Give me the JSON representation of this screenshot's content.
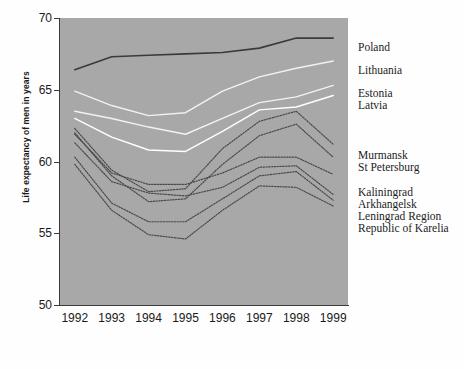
{
  "chart_data": {
    "type": "line",
    "title": "",
    "subtitle": "",
    "xlabel": "",
    "ylabel": "Life expectancy of men in years",
    "x": [
      1992,
      1993,
      1994,
      1995,
      1996,
      1997,
      1998,
      1999
    ],
    "xtick_labels": [
      "1992",
      "1993",
      "1994",
      "1995",
      "1996",
      "1997",
      "1998",
      "1999"
    ],
    "ytick_labels": [
      "50",
      "55",
      "60",
      "65",
      "70"
    ],
    "yticks": [
      50,
      55,
      60,
      65,
      70
    ],
    "ylim": [
      50,
      70
    ],
    "xlim": [
      1991.6,
      1999.4
    ],
    "grid": false,
    "legend_position": "right",
    "plot_background": "#a8a8a8",
    "series": [
      {
        "name": "Poland",
        "color": "#3a3a3a",
        "style": "solid",
        "width": 1.6,
        "label_y": 42,
        "values": [
          66.4,
          67.3,
          67.4,
          67.5,
          67.6,
          67.9,
          68.6,
          68.6
        ]
      },
      {
        "name": "Lithuania",
        "color": "#f2f2f2",
        "style": "solid",
        "width": 1.4,
        "label_y": 65,
        "values": [
          64.9,
          63.9,
          63.2,
          63.4,
          64.9,
          65.9,
          66.5,
          67.0
        ]
      },
      {
        "name": "Estonia",
        "color": "#f2f2f2",
        "style": "solid",
        "width": 1.4,
        "label_y": 88,
        "values": [
          63.5,
          63.0,
          62.4,
          61.9,
          63.0,
          64.1,
          64.5,
          65.3
        ]
      },
      {
        "name": "Latvia",
        "color": "#ffffff",
        "style": "solid",
        "width": 1.4,
        "label_y": 100,
        "values": [
          63.0,
          61.7,
          60.8,
          60.7,
          62.1,
          63.6,
          63.8,
          64.6
        ]
      },
      {
        "name": "Murmansk",
        "color": "#4a4a4a",
        "style": "dotted",
        "width": 1.2,
        "label_y": 150,
        "values": [
          62.3,
          59.4,
          57.9,
          58.1,
          60.9,
          62.8,
          63.5,
          61.2
        ]
      },
      {
        "name": "St Petersburg",
        "color": "#4a4a4a",
        "style": "dotted",
        "width": 1.2,
        "label_y": 162,
        "values": [
          62.0,
          59.0,
          57.2,
          57.4,
          59.8,
          61.8,
          62.6,
          60.3
        ]
      },
      {
        "name": "Kaliningrad",
        "color": "#4a4a4a",
        "style": "dotted",
        "width": 1.2,
        "label_y": 187,
        "values": [
          61.9,
          59.2,
          58.4,
          58.4,
          59.2,
          60.3,
          60.3,
          59.1
        ]
      },
      {
        "name": "Arkhangelsk",
        "color": "#4a4a4a",
        "style": "dotted",
        "width": 1.2,
        "label_y": 199,
        "values": [
          61.3,
          58.6,
          57.8,
          57.6,
          58.2,
          59.6,
          59.7,
          57.7
        ]
      },
      {
        "name": "Leningrad Region",
        "color": "#4a4a4a",
        "style": "dotted",
        "width": 1.2,
        "label_y": 211,
        "values": [
          60.3,
          57.1,
          55.8,
          55.8,
          57.4,
          59.0,
          59.3,
          57.3
        ]
      },
      {
        "name": "Republic of Karelia",
        "color": "#4a4a4a",
        "style": "dotted",
        "width": 1.2,
        "label_y": 223,
        "values": [
          59.8,
          56.6,
          54.9,
          54.6,
          56.6,
          58.3,
          58.2,
          56.9
        ]
      }
    ]
  }
}
